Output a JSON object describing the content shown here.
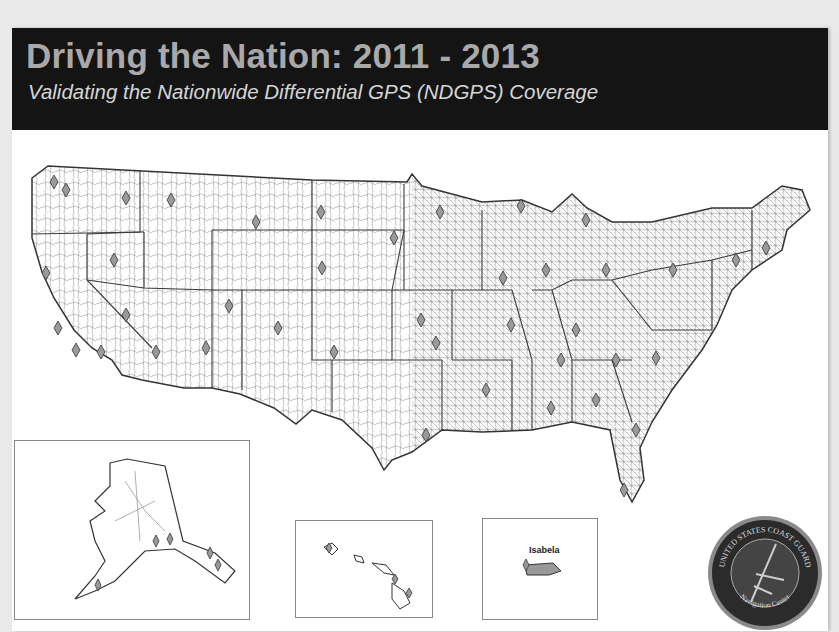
{
  "header": {
    "title": "Driving the Nation: 2011 - 2013",
    "subtitle": "Validating the Nationwide Differential GPS (NDGPS) Coverage"
  },
  "map": {
    "main_region": "Contiguous United States",
    "marker_icon": "diamond-marker-icon",
    "insets": [
      {
        "name": "Alaska"
      },
      {
        "name": "Hawaii"
      },
      {
        "name": "Puerto Rico",
        "label": "Isabela"
      }
    ]
  },
  "seal": {
    "top_text": "UNITED STATES COAST GUARD",
    "bottom_text": "Navigation Center"
  },
  "colors": {
    "banner": "#141414",
    "title": "#a9a9a9",
    "subtitle": "#d6d6d6",
    "roads": "#8c8c8c",
    "state_borders": "#3a3a3a",
    "markers": "#9a9a9a"
  }
}
